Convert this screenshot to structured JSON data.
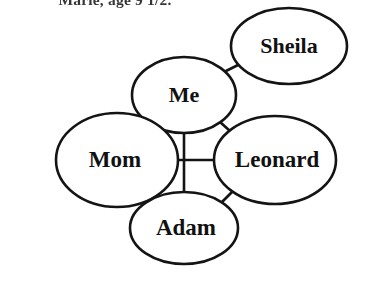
{
  "caption": {
    "text": "Marie, age 9 1/2.",
    "note": "partially cropped at top edge of scan"
  },
  "diagram": {
    "style": {
      "background_color": "#ffffff",
      "stroke_color": "#141414",
      "text_color": "#111111",
      "stroke_width": 2.6
    },
    "nodes": [
      {
        "id": "sheila",
        "label": "Sheila",
        "cx": 289,
        "cy": 46,
        "rx": 58,
        "ry": 38,
        "font_size": 22
      },
      {
        "id": "me",
        "label": "Me",
        "cx": 184,
        "cy": 95,
        "rx": 52,
        "ry": 38,
        "font_size": 22
      },
      {
        "id": "mom",
        "label": "Mom",
        "cx": 117,
        "cy": 160,
        "rx": 61,
        "ry": 47,
        "font_size": 23
      },
      {
        "id": "leonard",
        "label": "Leonard",
        "cx": 275,
        "cy": 160,
        "rx": 61,
        "ry": 44,
        "font_size": 23
      },
      {
        "id": "adam",
        "label": "Adam",
        "cx": 184,
        "cy": 228,
        "rx": 54,
        "ry": 36,
        "font_size": 23
      }
    ],
    "edges": [
      {
        "id": "me-sheila",
        "from": "me",
        "to": "sheila",
        "kind": "diagonal",
        "x1": 222,
        "y1": 73,
        "x2": 248,
        "y2": 60
      },
      {
        "id": "me-mom",
        "from": "me",
        "to": "mom",
        "kind": "diagonal",
        "x1": 148,
        "y1": 122,
        "x2": 128,
        "y2": 140
      },
      {
        "id": "me-leonard",
        "from": "me",
        "to": "leonard",
        "kind": "diagonal",
        "x1": 220,
        "y1": 122,
        "x2": 240,
        "y2": 140
      },
      {
        "id": "mom-adam",
        "from": "mom",
        "to": "adam",
        "kind": "diagonal",
        "x1": 131,
        "y1": 186,
        "x2": 148,
        "y2": 204
      },
      {
        "id": "leonard-adam",
        "from": "leonard",
        "to": "adam",
        "kind": "diagonal",
        "x1": 238,
        "y1": 186,
        "x2": 220,
        "y2": 204
      },
      {
        "id": "me-adam",
        "from": "me",
        "to": "adam",
        "kind": "vertical",
        "x1": 184,
        "y1": 133,
        "x2": 184,
        "y2": 193
      },
      {
        "id": "mom-leonard",
        "from": "mom",
        "to": "leonard",
        "kind": "horizontal",
        "x1": 155,
        "y1": 160,
        "x2": 215,
        "y2": 160
      }
    ]
  }
}
